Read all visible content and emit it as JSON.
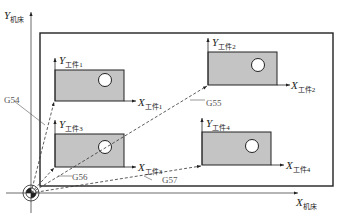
{
  "machine": {
    "y_axis": {
      "main": "Y",
      "sub": "机床"
    },
    "x_axis": {
      "main": "X",
      "sub": "机床"
    }
  },
  "workpieces": [
    {
      "id": 1,
      "y_label": {
        "main": "Y",
        "sub": "工件1"
      },
      "x_label": {
        "main": "X",
        "sub": "工件1"
      },
      "offset": "G54"
    },
    {
      "id": 2,
      "y_label": {
        "main": "Y",
        "sub": "工件2"
      },
      "x_label": {
        "main": "X",
        "sub": "工件2"
      },
      "offset": "G55"
    },
    {
      "id": 3,
      "y_label": {
        "main": "Y",
        "sub": "工件3"
      },
      "x_label": {
        "main": "X",
        "sub": "工件3"
      },
      "offset": "G56"
    },
    {
      "id": 4,
      "y_label": {
        "main": "Y",
        "sub": "工件4"
      },
      "x_label": {
        "main": "X",
        "sub": "工件4"
      },
      "offset": "G57"
    }
  ],
  "colors": {
    "workpiece_fill": "#c4c4c4",
    "stroke": "#222222",
    "dashed": "#333333",
    "label_gray": "#555555"
  }
}
